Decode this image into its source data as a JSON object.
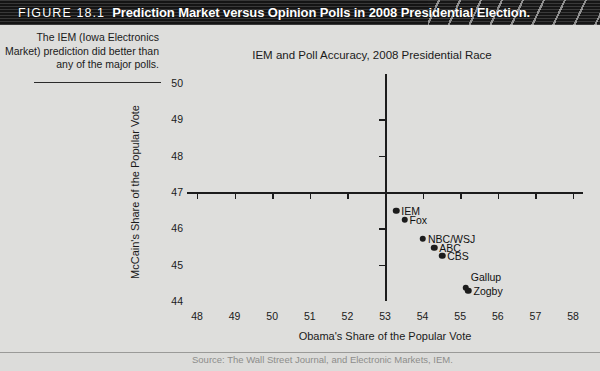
{
  "figure": {
    "number_label": "FIGURE 18.1",
    "title": "Prediction Market versus Opinion Polls in 2008 Presidential Election.",
    "caption": "The IEM (Iowa Electronics Market) prediction did better than any of the major polls.",
    "source": "Source: The Wall Street Journal, and Electronic Markets, IEM."
  },
  "chart_data": {
    "type": "scatter",
    "title": "IEM and Poll Accuracy, 2008 Presidential Race",
    "xlabel": "Obama's Share of the Popular Vote",
    "ylabel": "McCain's Share of the Popular Vote",
    "xlim": [
      48,
      58
    ],
    "ylim": [
      44,
      50
    ],
    "xticks": [
      48,
      49,
      50,
      51,
      52,
      53,
      54,
      55,
      56,
      57,
      58
    ],
    "yticks": [
      44,
      45,
      46,
      47,
      48,
      49,
      50
    ],
    "xtick_labels": [
      "48",
      "49",
      "50",
      "51",
      "52",
      "53",
      "54",
      "55",
      "56",
      "57",
      "58"
    ],
    "ytick_labels": [
      "44",
      "45",
      "46",
      "47",
      "48",
      "49",
      "50"
    ],
    "grid": false,
    "legend": "none",
    "axis_style": "crosshair",
    "axis_origin": [
      53,
      47
    ],
    "marker_color": "#1c1c1c",
    "points": [
      {
        "name": "IEM",
        "x": 53.3,
        "y": 46.48,
        "label_side": "right"
      },
      {
        "name": "Fox",
        "x": 53.52,
        "y": 46.23,
        "label_side": "right"
      },
      {
        "name": "NBC/WSJ",
        "x": 54.01,
        "y": 45.71,
        "label_side": "right"
      },
      {
        "name": "ABC",
        "x": 54.31,
        "y": 45.46,
        "label_side": "right"
      },
      {
        "name": "CBS",
        "x": 54.52,
        "y": 45.24,
        "label_side": "right"
      },
      {
        "name": "Gallup",
        "x": 55.15,
        "y": 44.36,
        "label_side": "right-up"
      },
      {
        "name": "Zogby",
        "x": 55.22,
        "y": 44.28,
        "label_side": "right"
      }
    ]
  }
}
